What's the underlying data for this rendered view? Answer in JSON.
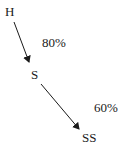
{
  "diagram": {
    "nodes": [
      {
        "id": "H",
        "label": "H"
      },
      {
        "id": "S",
        "label": "S"
      },
      {
        "id": "SS",
        "label": "SS"
      }
    ],
    "edges": [
      {
        "from": "H",
        "to": "S",
        "label": "80%"
      },
      {
        "from": "S",
        "to": "SS",
        "label": "60%"
      }
    ],
    "colors": {
      "ink": "#1a1a1a",
      "background": "#ffffff"
    }
  }
}
